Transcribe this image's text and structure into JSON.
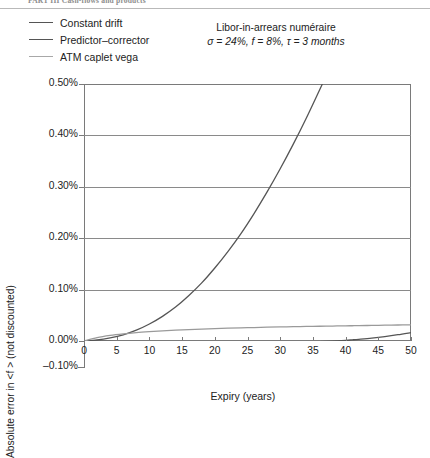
{
  "header": {
    "running_title": "PART III  Cash-flows and products"
  },
  "legend": {
    "position": "top-left",
    "items": [
      {
        "label": "Constant drift",
        "color": "#555555"
      },
      {
        "label": "Predictor–corrector",
        "color": "#555555"
      },
      {
        "label": "ATM caplet vega",
        "color": "#9a9a9a"
      }
    ]
  },
  "annotation": {
    "line1": "Libor-in-arrears numéraire",
    "line2_sigma": "σ = 24%,",
    "line2_f": "f = 8%,",
    "line2_tau": "τ = 3 months"
  },
  "chart_data": {
    "type": "line",
    "title": "",
    "xlabel": "Expiry (years)",
    "ylabel": "Absolute error in <f > (not discounted)",
    "xlim": [
      0,
      50
    ],
    "ylim": [
      -0.1,
      0.5
    ],
    "xticks": [
      0,
      5,
      10,
      15,
      20,
      25,
      30,
      35,
      40,
      45,
      50
    ],
    "xtick_labels": [
      "0",
      "5",
      "10",
      "15",
      "20",
      "25",
      "30",
      "35",
      "40",
      "45",
      "50"
    ],
    "yticks": [
      -0.1,
      0.0,
      0.1,
      0.2,
      0.3,
      0.4,
      0.5
    ],
    "ytick_labels": [
      "–0.10%",
      "0.00%",
      "0.10%",
      "0.20%",
      "0.30%",
      "0.40%",
      "0.50%"
    ],
    "y_unit": "percent",
    "grid": "horizontal",
    "legend_position": "above-plot-left",
    "x": [
      0,
      2,
      4,
      6,
      8,
      10,
      12,
      14,
      16,
      18,
      20,
      22,
      24,
      26,
      28,
      30,
      32,
      34,
      36,
      38,
      40,
      41,
      42,
      44,
      46,
      48,
      50
    ],
    "series": [
      {
        "name": "Constant drift",
        "color": "#555555",
        "clipped_at_top": true,
        "clip_x": 41,
        "values": [
          0.0,
          0.002,
          0.006,
          0.012,
          0.021,
          0.033,
          0.048,
          0.066,
          0.088,
          0.113,
          0.142,
          0.174,
          0.209,
          0.248,
          0.29,
          0.335,
          0.383,
          0.434,
          0.488,
          null,
          null,
          null,
          null,
          null,
          null,
          null,
          null
        ]
      },
      {
        "name": "Predictor–corrector",
        "color": "#555555",
        "values": [
          0.0,
          -0.0005,
          -0.001,
          -0.0015,
          -0.0019,
          -0.0022,
          -0.0024,
          -0.0026,
          -0.0028,
          -0.003,
          -0.0032,
          -0.0033,
          -0.0034,
          -0.0034,
          -0.0033,
          -0.0031,
          -0.0027,
          -0.0021,
          -0.0013,
          -0.0002,
          0.0013,
          0.0022,
          0.0032,
          0.0056,
          0.0086,
          0.0122,
          0.0163
        ]
      },
      {
        "name": "ATM caplet vega",
        "color": "#9a9a9a",
        "values": [
          0.0,
          0.0065,
          0.0108,
          0.0139,
          0.0163,
          0.0182,
          0.0198,
          0.0211,
          0.0222,
          0.0232,
          0.0241,
          0.0249,
          0.0256,
          0.0262,
          0.0268,
          0.0273,
          0.0278,
          0.0283,
          0.0287,
          0.0291,
          0.0295,
          0.0297,
          0.0299,
          0.0303,
          0.0307,
          0.0311,
          0.0315
        ]
      }
    ]
  }
}
